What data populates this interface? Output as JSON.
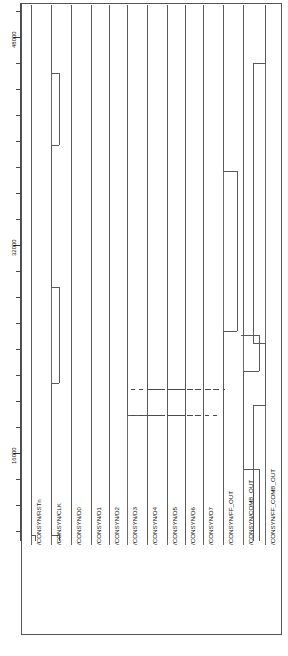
{
  "figure": {
    "kind": "digital-timing-waveform",
    "orientation": "rotated-90",
    "frame_color": "#555555",
    "trace_color": "#5a5a5a",
    "background": "#ffffff"
  },
  "time_axis": {
    "label": "",
    "tick_labels": [
      "48000",
      "32000",
      "16000"
    ],
    "tick_label_values": [
      48000,
      32000,
      16000
    ],
    "minor_tick_count": 20,
    "range": [
      0,
      56000
    ]
  },
  "signals": [
    {
      "name": "/CONSYN/RSTn",
      "x": 6,
      "kind": "reset"
    },
    {
      "name": "/CONSYN/CLK",
      "x": 26,
      "kind": "clock"
    },
    {
      "name": "/CONSYN/D0",
      "x": 46,
      "kind": "data"
    },
    {
      "name": "/CONSYN/D1",
      "x": 66,
      "kind": "data"
    },
    {
      "name": "/CONSYN/D2",
      "x": 84,
      "kind": "data"
    },
    {
      "name": "/CONSYN/D3",
      "x": 102,
      "kind": "data"
    },
    {
      "name": "/CONSYN/D4",
      "x": 122,
      "kind": "data"
    },
    {
      "name": "/CONSYN/D5",
      "x": 142,
      "kind": "data"
    },
    {
      "name": "/CONSYN/D6",
      "x": 160,
      "kind": "data"
    },
    {
      "name": "/CONSYN/D7",
      "x": 178,
      "kind": "data"
    },
    {
      "name": "/CONSYN/FF_OUT",
      "x": 198,
      "kind": "output"
    },
    {
      "name": "/CONSYN/COMB_OUT",
      "x": 218,
      "kind": "output"
    },
    {
      "name": "/CONSYN/FF_COMB_OUT",
      "x": 240,
      "kind": "output"
    }
  ],
  "chart_data": {
    "type": "line",
    "title": "",
    "xlabel": "",
    "ylabel": "",
    "categories": [
      "/CONSYN/RSTn",
      "/CONSYN/CLK",
      "/CONSYN/D0",
      "/CONSYN/D1",
      "/CONSYN/D2",
      "/CONSYN/D3",
      "/CONSYN/D4",
      "/CONSYN/D5",
      "/CONSYN/D6",
      "/CONSYN/D7",
      "/CONSYN/FF_OUT",
      "/CONSYN/COMB_OUT",
      "/CONSYN/FF_COMB_OUT"
    ],
    "ylim": [
      0,
      56000
    ],
    "grid": false,
    "legend": "none",
    "tick_labels": [
      "48000",
      "32000",
      "16000"
    ]
  }
}
